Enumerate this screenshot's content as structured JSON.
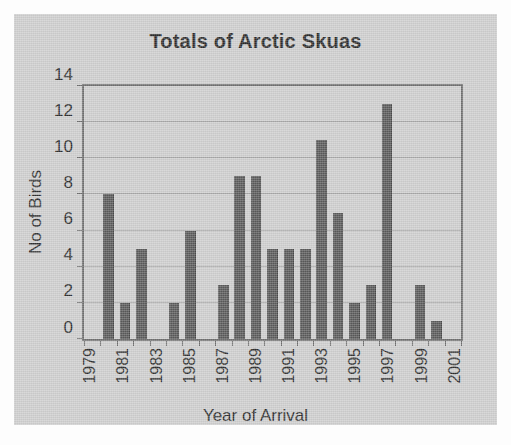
{
  "figure": {
    "background_color": "#cdcdcd",
    "plot_border_color": "#6f6f6f",
    "gridline_color": "#a7a7a7",
    "bar_color": "#595959"
  },
  "chart_data": {
    "type": "bar",
    "title": "Totals of Arctic Skuas",
    "xlabel": "Year of Arrival",
    "ylabel": "No of Birds",
    "grid": true,
    "legend": null,
    "ylim": [
      0,
      14
    ],
    "yticks": [
      0,
      2,
      4,
      6,
      8,
      10,
      12,
      14
    ],
    "ytick_labels": [
      "0",
      "2",
      "4",
      "6",
      "8",
      "10",
      "12",
      "14"
    ],
    "xtick_labels": [
      "1979",
      "1981",
      "1983",
      "1985",
      "1987",
      "1989",
      "1991",
      "1993",
      "1995",
      "1997",
      "1999",
      "2001"
    ],
    "xtick_label_rotation": -90,
    "categories": [
      "1979",
      "1980",
      "1981",
      "1982",
      "1983",
      "1984",
      "1985",
      "1986",
      "1987",
      "1988",
      "1989",
      "1990",
      "1991",
      "1992",
      "1993",
      "1994",
      "1995",
      "1996",
      "1997",
      "1998",
      "1999",
      "2000",
      "2001"
    ],
    "values": [
      0,
      8,
      2,
      5,
      0,
      2,
      6,
      0,
      3,
      9,
      9,
      5,
      5,
      5,
      11,
      7,
      2,
      3,
      13,
      0,
      3,
      1,
      0
    ],
    "points": [
      {
        "year": "1979",
        "birds": 0
      },
      {
        "year": "1980",
        "birds": 8
      },
      {
        "year": "1981",
        "birds": 2
      },
      {
        "year": "1982",
        "birds": 5
      },
      {
        "year": "1983",
        "birds": 0
      },
      {
        "year": "1984",
        "birds": 2
      },
      {
        "year": "1985",
        "birds": 6
      },
      {
        "year": "1986",
        "birds": 0
      },
      {
        "year": "1987",
        "birds": 3
      },
      {
        "year": "1988",
        "birds": 9
      },
      {
        "year": "1989",
        "birds": 9
      },
      {
        "year": "1990",
        "birds": 5
      },
      {
        "year": "1991",
        "birds": 5
      },
      {
        "year": "1992",
        "birds": 5
      },
      {
        "year": "1993",
        "birds": 11
      },
      {
        "year": "1994",
        "birds": 7
      },
      {
        "year": "1995",
        "birds": 2
      },
      {
        "year": "1996",
        "birds": 3
      },
      {
        "year": "1997",
        "birds": 13
      },
      {
        "year": "1998",
        "birds": 0
      },
      {
        "year": "1999",
        "birds": 3
      },
      {
        "year": "2000",
        "birds": 1
      },
      {
        "year": "2001",
        "birds": 0
      }
    ]
  }
}
